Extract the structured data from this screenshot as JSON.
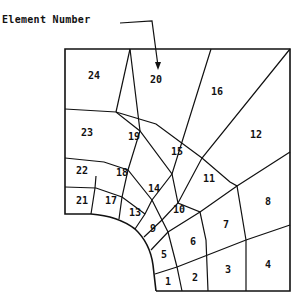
{
  "diagram": {
    "type": "finite-element-mesh",
    "annotation": {
      "label": "Element Number",
      "points_to_element": "20"
    },
    "nodes": {
      "top": [
        [
          65,
          49
        ],
        [
          130,
          49
        ],
        [
          211,
          49
        ],
        [
          290,
          49
        ]
      ],
      "right": [
        [
          290,
          49
        ],
        [
          290,
          152
        ],
        [
          290,
          225
        ],
        [
          290,
          291
        ]
      ],
      "bottom": [
        [
          156,
          291
        ],
        [
          182,
          291
        ],
        [
          208,
          291
        ],
        [
          246,
          291
        ],
        [
          290,
          291
        ]
      ],
      "left": [
        [
          65,
          49
        ],
        [
          65,
          109
        ],
        [
          65,
          158
        ],
        [
          65,
          187
        ],
        [
          65,
          214
        ]
      ]
    },
    "elements": [
      {
        "id": "1",
        "x": 168,
        "y": 282
      },
      {
        "id": "2",
        "x": 195,
        "y": 278
      },
      {
        "id": "3",
        "x": 228,
        "y": 270
      },
      {
        "id": "4",
        "x": 268,
        "y": 265
      },
      {
        "id": "5",
        "x": 164,
        "y": 255
      },
      {
        "id": "6",
        "x": 193,
        "y": 242
      },
      {
        "id": "7",
        "x": 226,
        "y": 225
      },
      {
        "id": "8",
        "x": 268,
        "y": 202
      },
      {
        "id": "9",
        "x": 153,
        "y": 229
      },
      {
        "id": "10",
        "x": 179,
        "y": 210
      },
      {
        "id": "11",
        "x": 209,
        "y": 179
      },
      {
        "id": "12",
        "x": 256,
        "y": 135
      },
      {
        "id": "13",
        "x": 135,
        "y": 213
      },
      {
        "id": "14",
        "x": 154,
        "y": 189
      },
      {
        "id": "15",
        "x": 177,
        "y": 152
      },
      {
        "id": "16",
        "x": 217,
        "y": 92
      },
      {
        "id": "17",
        "x": 111,
        "y": 201
      },
      {
        "id": "18",
        "x": 122,
        "y": 173
      },
      {
        "id": "19",
        "x": 134,
        "y": 137
      },
      {
        "id": "20",
        "x": 156,
        "y": 80
      },
      {
        "id": "21",
        "x": 82,
        "y": 201
      },
      {
        "id": "22",
        "x": 82,
        "y": 171
      },
      {
        "id": "23",
        "x": 87,
        "y": 133
      },
      {
        "id": "24",
        "x": 94,
        "y": 76
      }
    ]
  }
}
